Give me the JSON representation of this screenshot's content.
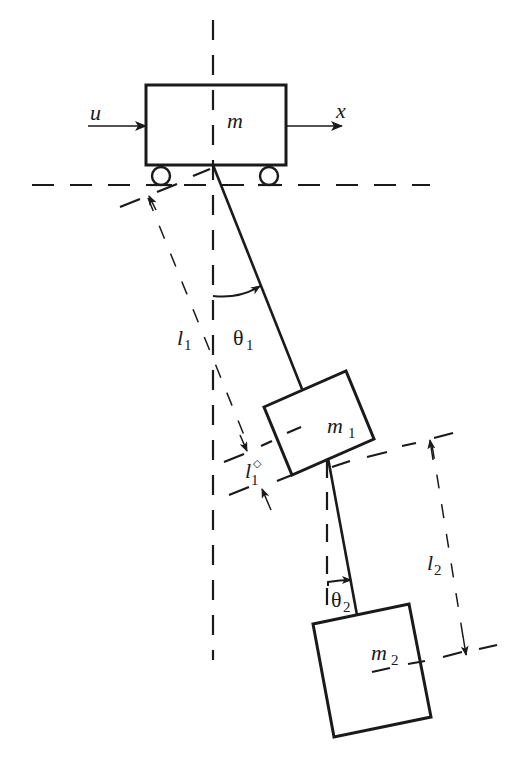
{
  "diagram": {
    "labels": {
      "force": "u",
      "position": "x",
      "cart_mass": "m",
      "mass1": {
        "base": "m",
        "sub": "1"
      },
      "mass2": {
        "base": "m",
        "sub": "2"
      },
      "length1": {
        "base": "l",
        "sub": "1"
      },
      "length1_offset": {
        "base": "l",
        "sub": "1",
        "sup": "◇"
      },
      "length2": {
        "base": "l",
        "sub": "2"
      },
      "angle1": {
        "base": "θ",
        "sub": "1"
      },
      "angle2": {
        "base": "θ",
        "sub": "2"
      }
    },
    "colors": {
      "ink": "#1a1a1a",
      "background": "#ffffff"
    }
  }
}
